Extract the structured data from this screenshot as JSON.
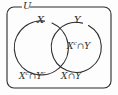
{
  "figure": {
    "type": "venn-diagram",
    "width": 118,
    "height": 95,
    "colors": {
      "stroke": "#2b2b2b",
      "background": "#fdfdfd",
      "text": "#2b2b2b"
    },
    "universe": {
      "label": "U",
      "shape": "rounded-rectangle",
      "x": 7,
      "y": 7,
      "width": 104,
      "height": 81,
      "corner_radius": 7
    },
    "sets": [
      {
        "name": "X",
        "label": "X",
        "cx": 42,
        "cy": 48,
        "r": 27
      },
      {
        "name": "Y",
        "label": "Y",
        "cx": 80,
        "cy": 48,
        "r": 25
      }
    ],
    "regions": [
      {
        "name": "complement-x-intersect-y",
        "base": "X",
        "superscript": "c",
        "operator": "∩",
        "second": "Y",
        "text": "Xᶜ∩Y"
      },
      {
        "name": "complement-x-intersect-complement-y",
        "base": "X",
        "superscript": "c",
        "operator": "∩",
        "second": "Y",
        "second_superscript": "c",
        "text": "Xᶜ∩Yᶜ"
      },
      {
        "name": "x-intersect-y",
        "base": "X",
        "operator": "∩",
        "second": "Y",
        "text": "X∩Y"
      }
    ],
    "glyphs": {
      "intersection": "∩",
      "complement": "c"
    }
  }
}
